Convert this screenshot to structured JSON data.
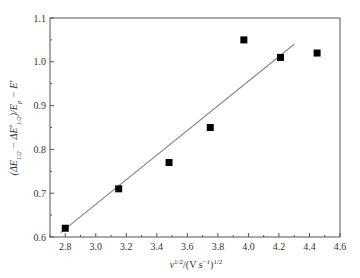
{
  "chart_data": {
    "type": "scatter",
    "title": "",
    "xlabel": "ν^1/2/(V s^-1)^1/2",
    "ylabel": "(ΔE1/2 − ΔE'1/2)/Ep − E'",
    "xlim": [
      2.7,
      4.6
    ],
    "ylim": [
      0.6,
      1.1
    ],
    "x_ticks": [
      "2.8",
      "3.0",
      "3.2",
      "3.4",
      "3.6",
      "3.8",
      "4.0",
      "4.2",
      "4.4",
      "4.6"
    ],
    "y_ticks": [
      "0.6",
      "0.7",
      "0.8",
      "0.9",
      "1.0",
      "1.1"
    ],
    "grid": false,
    "legend": null,
    "series": [
      {
        "name": "data",
        "marker": "square",
        "color": "#000000",
        "x": [
          2.8,
          3.15,
          3.48,
          3.75,
          3.97,
          4.21,
          4.45
        ],
        "y": [
          0.62,
          0.71,
          0.77,
          0.85,
          1.05,
          1.01,
          1.02
        ]
      },
      {
        "name": "linear fit",
        "type": "line",
        "color": "#888888",
        "x": [
          2.77,
          4.3
        ],
        "y": [
          0.61,
          1.04
        ]
      }
    ]
  },
  "labels": {
    "xlabel_main": "ν",
    "xlabel_sup1": "1/2",
    "xlabel_mid": "/(V s",
    "xlabel_sup2": "−1",
    "xlabel_end": ")",
    "xlabel_sup3": "1/2",
    "ylabel": "(ΔE1/2 − ΔE′1/2)/Ep − E′"
  }
}
